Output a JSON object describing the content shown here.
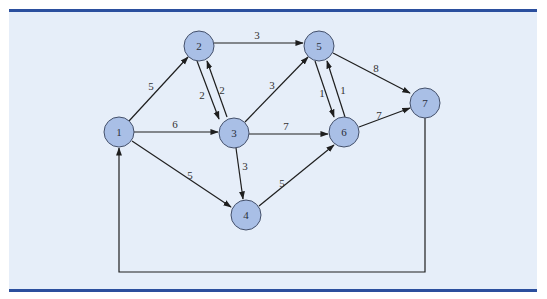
{
  "colors": {
    "panel_background": "#e6eef9",
    "rule": "#2b4f9e",
    "node_fill": "#a9bfe6",
    "node_stroke": "#44506a",
    "edge": "#1e1e1e"
  },
  "nodes": [
    {
      "id": "1",
      "label": "1",
      "x": 119,
      "y": 132
    },
    {
      "id": "2",
      "label": "2",
      "x": 199,
      "y": 46
    },
    {
      "id": "3",
      "label": "3",
      "x": 234,
      "y": 133
    },
    {
      "id": "4",
      "label": "4",
      "x": 246,
      "y": 215
    },
    {
      "id": "5",
      "label": "5",
      "x": 319,
      "y": 46
    },
    {
      "id": "6",
      "label": "6",
      "x": 344,
      "y": 132
    },
    {
      "id": "7",
      "label": "7",
      "x": 425,
      "y": 103
    }
  ],
  "edges": [
    {
      "from": "1",
      "to": "2",
      "weight": "5"
    },
    {
      "from": "1",
      "to": "3",
      "weight": "6"
    },
    {
      "from": "1",
      "to": "4",
      "weight": "5"
    },
    {
      "from": "2",
      "to": "5",
      "weight": "3"
    },
    {
      "from": "2",
      "to": "3",
      "weight": "2"
    },
    {
      "from": "3",
      "to": "2",
      "weight": "2"
    },
    {
      "from": "3",
      "to": "5",
      "weight": "3"
    },
    {
      "from": "3",
      "to": "6",
      "weight": "7"
    },
    {
      "from": "3",
      "to": "4",
      "weight": "3"
    },
    {
      "from": "4",
      "to": "6",
      "weight": "5"
    },
    {
      "from": "5",
      "to": "7",
      "weight": "8"
    },
    {
      "from": "5",
      "to": "6",
      "weight": "1"
    },
    {
      "from": "6",
      "to": "5",
      "weight": "1"
    },
    {
      "from": "6",
      "to": "7",
      "weight": "7"
    },
    {
      "from": "7",
      "to": "1",
      "weight": "",
      "routing": "down to y=272, left to x=119, up to node 1"
    }
  ],
  "labels": {
    "n1": "1",
    "n2": "2",
    "n3": "3",
    "n4": "4",
    "n5": "5",
    "n6": "6",
    "n7": "7",
    "e12": "5",
    "e13": "6",
    "e14": "5",
    "e25": "3",
    "e23": "2",
    "e32": "2",
    "e35": "3",
    "e36": "7",
    "e34": "3",
    "e46": "5",
    "e57": "8",
    "e56": "1",
    "e65": "1",
    "e67": "7"
  }
}
